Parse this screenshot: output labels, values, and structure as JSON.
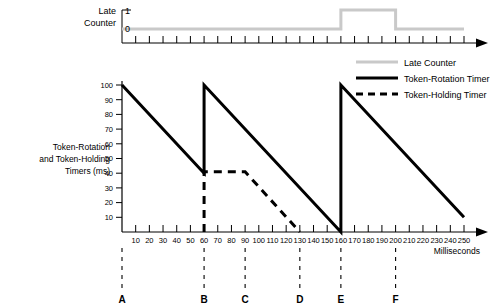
{
  "top_panel": {
    "label_line1": "Late",
    "label_line2": "Counter",
    "y_ticks": [
      "1",
      "0"
    ]
  },
  "main_panel": {
    "y_axis_label_line1": "Token-Rotation",
    "y_axis_label_line2": "and Token-Holding",
    "y_axis_label_line3": "Timers (ms)",
    "x_axis_label": "Milliseconds"
  },
  "legend": {
    "items": [
      {
        "label": "Late Counter",
        "style": "solid",
        "color": "#c9c9c9",
        "width": 3
      },
      {
        "label": "Token-Rotation Timer",
        "style": "solid",
        "color": "#000000",
        "width": 3
      },
      {
        "label": "Token-Holding Timer",
        "style": "dashed",
        "color": "#000000",
        "width": 3
      }
    ]
  },
  "markers": [
    {
      "label": "A",
      "x": 0
    },
    {
      "label": "B",
      "x": 60
    },
    {
      "label": "C",
      "x": 90
    },
    {
      "label": "D",
      "x": 130
    },
    {
      "label": "E",
      "x": 160
    },
    {
      "label": "F",
      "x": 200
    }
  ],
  "chart_data": {
    "type": "line",
    "title": "",
    "xlabel": "Milliseconds",
    "ylabel": "Token-Rotation and Token-Holding Timers (ms)",
    "xlim": [
      0,
      250
    ],
    "ylim": [
      0,
      100
    ],
    "xticks": [
      10,
      20,
      30,
      40,
      50,
      60,
      70,
      80,
      90,
      100,
      110,
      120,
      130,
      140,
      150,
      160,
      170,
      180,
      190,
      200,
      210,
      220,
      230,
      240,
      250
    ],
    "yticks": [
      10,
      20,
      30,
      40,
      50,
      60,
      70,
      80,
      90,
      100
    ],
    "grid": false,
    "legend_position": "top-right",
    "series": [
      {
        "name": "Token-Rotation Timer",
        "style": "solid",
        "color": "#000000",
        "points": [
          {
            "x": 0,
            "y": 100
          },
          {
            "x": 60,
            "y": 40
          },
          {
            "x": 60,
            "y": 100
          },
          {
            "x": 160,
            "y": 0
          },
          {
            "x": 160,
            "y": 100
          },
          {
            "x": 250,
            "y": 10
          }
        ]
      },
      {
        "name": "Token-Holding Timer",
        "style": "dashed",
        "color": "#000000",
        "points": [
          {
            "x": 60,
            "y": 0
          },
          {
            "x": 60,
            "y": 41
          },
          {
            "x": 90,
            "y": 41
          },
          {
            "x": 130,
            "y": 0
          }
        ]
      }
    ],
    "secondary_panel": {
      "name": "Late Counter",
      "type": "step",
      "color": "#c9c9c9",
      "ylim": [
        0,
        1
      ],
      "yticks": [
        0,
        1
      ],
      "points": [
        {
          "x": 0,
          "y": 0
        },
        {
          "x": 160,
          "y": 0
        },
        {
          "x": 160,
          "y": 1
        },
        {
          "x": 200,
          "y": 1
        },
        {
          "x": 200,
          "y": 0
        },
        {
          "x": 250,
          "y": 0
        }
      ]
    }
  }
}
